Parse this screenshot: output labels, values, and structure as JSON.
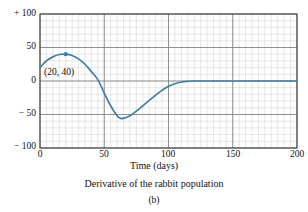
{
  "figure": {
    "caption": "Derivative of the rabbit population",
    "subcaption": "(b)"
  },
  "chart_data": {
    "type": "line",
    "title": "",
    "caption": "Derivative of the rabbit population",
    "panel_label": "(b)",
    "xlabel": "Time (days)",
    "ylabel": "",
    "xlim": [
      0,
      200
    ],
    "ylim": [
      -100,
      100
    ],
    "xticks": [
      0,
      50,
      100,
      150,
      200
    ],
    "xtick_labels": [
      "0",
      "50",
      "100",
      "150",
      "200"
    ],
    "yticks": [
      100,
      50,
      0,
      -50,
      -100
    ],
    "ytick_labels": [
      "+ 100",
      "50",
      "0",
      "− 50",
      "− 100"
    ],
    "grid": true,
    "grid_minor_x_step": 5,
    "grid_minor_y_step": 10,
    "grid_major_x_step": 50,
    "grid_major_y_step": 50,
    "legend": false,
    "legend_position": "none",
    "series": [
      {
        "name": "Derivative of rabbit population",
        "color": "#3f7fa6",
        "x": [
          0,
          5,
          10,
          15,
          20,
          25,
          30,
          35,
          40,
          45,
          50,
          55,
          60,
          63,
          66,
          70,
          75,
          80,
          85,
          90,
          95,
          100,
          105,
          110,
          115,
          120,
          130,
          140,
          150,
          160,
          170,
          180,
          190,
          200
        ],
        "y": [
          20,
          30,
          36,
          39.5,
          40,
          38,
          33,
          25,
          14,
          2,
          -18,
          -37,
          -52,
          -56,
          -55,
          -52,
          -45,
          -37,
          -29,
          -21,
          -14,
          -8,
          -4,
          -1.5,
          -0.4,
          0,
          0,
          0,
          0,
          0,
          0,
          0,
          0,
          0
        ]
      }
    ],
    "annotations": [
      {
        "label": "(20, 40)",
        "point_x": 20,
        "point_y": 40,
        "marker": true,
        "marker_color": "#3f7fa6"
      }
    ]
  },
  "axis": {
    "x_title": "Time (days)"
  },
  "colors": {
    "curve": "#3f7fa6",
    "grid_minor": "#cfcfcf",
    "grid_major": "#6f6f6f",
    "axis": "#4a4a4a",
    "text": "#111111"
  }
}
